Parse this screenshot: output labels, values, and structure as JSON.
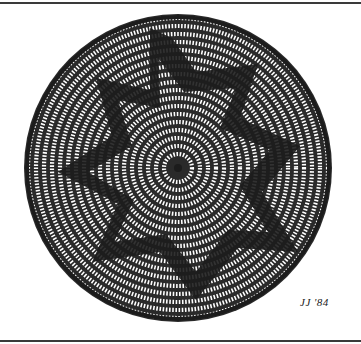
{
  "illustration": {
    "subject": "coiled basket with five-pointed star pattern",
    "signature": "JJ '84",
    "colors": {
      "ink": "#1c1c1c",
      "paper": "#ffffff",
      "rule": "#3a3a3a"
    }
  }
}
